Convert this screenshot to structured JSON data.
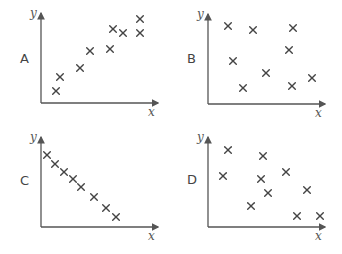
{
  "chart_data": [
    {
      "type": "scatter",
      "panel": "A",
      "xlabel": "x",
      "ylabel": "y",
      "description": "positive correlation",
      "points": [
        [
          15,
          12
        ],
        [
          19,
          26
        ],
        [
          39,
          35
        ],
        [
          49,
          52
        ],
        [
          69,
          54
        ],
        [
          72,
          74
        ],
        [
          82,
          70
        ],
        [
          99,
          84
        ],
        [
          99,
          70
        ]
      ]
    },
    {
      "type": "scatter",
      "panel": "B",
      "xlabel": "x",
      "ylabel": "y",
      "description": "no correlation",
      "points": [
        [
          20,
          78
        ],
        [
          45,
          74
        ],
        [
          85,
          76
        ],
        [
          25,
          43
        ],
        [
          58,
          31
        ],
        [
          81,
          54
        ],
        [
          35,
          16
        ],
        [
          84,
          18
        ],
        [
          104,
          26
        ]
      ]
    },
    {
      "type": "scatter",
      "panel": "C",
      "xlabel": "x",
      "ylabel": "y",
      "description": "strong negative correlation",
      "points": [
        [
          6,
          72
        ],
        [
          14,
          63
        ],
        [
          23,
          55
        ],
        [
          32,
          48
        ],
        [
          40,
          40
        ],
        [
          53,
          30
        ],
        [
          65,
          19
        ],
        [
          75,
          10
        ]
      ]
    },
    {
      "type": "scatter",
      "panel": "D",
      "xlabel": "x",
      "ylabel": "y",
      "description": "weak negative correlation",
      "points": [
        [
          20,
          77
        ],
        [
          55,
          71
        ],
        [
          15,
          51
        ],
        [
          53,
          48
        ],
        [
          78,
          55
        ],
        [
          60,
          34
        ],
        [
          99,
          37
        ],
        [
          43,
          21
        ],
        [
          89,
          11
        ],
        [
          112,
          11
        ]
      ]
    }
  ],
  "panels": [
    {
      "label": "A",
      "x_axis": "x",
      "y_axis": "y"
    },
    {
      "label": "B",
      "x_axis": "x",
      "y_axis": "y"
    },
    {
      "label": "C",
      "x_axis": "x",
      "y_axis": "y"
    },
    {
      "label": "D",
      "x_axis": "x",
      "y_axis": "y"
    }
  ]
}
